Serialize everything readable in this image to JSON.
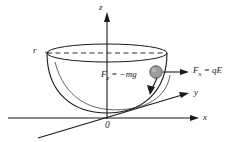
{
  "figure": {
    "background_color": "#ffffff",
    "stroke_color": "#1a1a1a",
    "bead_fill_color": "#9e9e9e",
    "bead_stroke_color": "#4a4a4a"
  },
  "axes": {
    "z_label": "z",
    "x_label": "x",
    "y_label": "y",
    "origin_label": "0"
  },
  "geometry": {
    "radius_label": "r"
  },
  "forces": [
    {
      "name": "electric-force",
      "label": "F",
      "subscript": "x",
      "equals": " = qE",
      "full_text": "Fx = qE",
      "direction": "right"
    },
    {
      "name": "gravity-force",
      "label": "F",
      "subscript": "z",
      "equals": " = −mg",
      "full_text": "Fz = −mg",
      "direction": "down"
    }
  ]
}
